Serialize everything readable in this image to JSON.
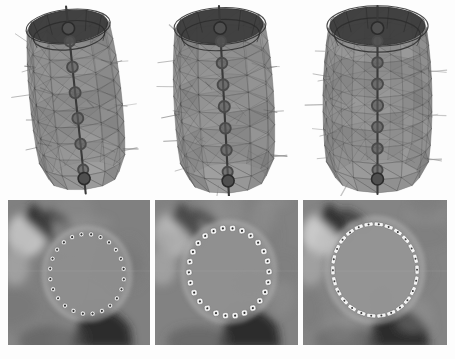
{
  "figure": {
    "layout": "2 rows x 3 columns",
    "background_color": "#fdfdfd",
    "rows": [
      {
        "row_name": "mesh-row",
        "description": "Wireframe triangulated 3D cylindrical mesh models shown from an oblique viewpoint, each with radial normal spikes and a central vertical chain of ring landmarks"
      },
      {
        "row_name": "slice-row",
        "description": "Grayscale cross-sectional image slices with a ring of contour control-point markers outlining a roughly circular structure"
      }
    ]
  },
  "meshes": [
    {
      "panel_name": "mesh-stage-1",
      "stage_label": "1",
      "shape": "narrow rounded cylinder",
      "mesh_color": "#6f6f6f",
      "edge_color": "#2b2b2b",
      "spike_color": "#8c8c8c",
      "ring_marker_color": "#4a4a4a",
      "ring_count": 6,
      "rim_rings": 2,
      "axis_tilt_deg": -6,
      "body_width": 92,
      "body_height": 150,
      "top_spike": true,
      "bottom_spike": true,
      "circumferential_bands": 9,
      "longitudinal_columns": 12,
      "spike_count": 26
    },
    {
      "panel_name": "mesh-stage-2",
      "stage_label": "2",
      "shape": "medium rounded cylinder",
      "mesh_color": "#757575",
      "edge_color": "#2b2b2b",
      "spike_color": "#8f8f8f",
      "ring_marker_color": "#4a4a4a",
      "ring_count": 7,
      "rim_rings": 2,
      "axis_tilt_deg": -3,
      "body_width": 100,
      "body_height": 152,
      "top_spike": true,
      "bottom_spike": true,
      "circumferential_bands": 9,
      "longitudinal_columns": 12,
      "spike_count": 28
    },
    {
      "panel_name": "mesh-stage-3",
      "stage_label": "3",
      "shape": "wide barrel cylinder",
      "mesh_color": "#7a7a7a",
      "edge_color": "#2b2b2b",
      "spike_color": "#949494",
      "ring_marker_color": "#4a4a4a",
      "ring_count": 7,
      "rim_rings": 2,
      "axis_tilt_deg": 0,
      "body_width": 110,
      "body_height": 150,
      "top_spike": true,
      "bottom_spike": true,
      "circumferential_bands": 9,
      "longitudinal_columns": 13,
      "spike_count": 30
    }
  ],
  "slices": [
    {
      "panel_name": "slice-stage-1",
      "stage_label": "1",
      "background_gray": "#808080",
      "interior_gray": "#8e8e8e",
      "bright_blob_gray": "#c8c8c8",
      "dark_band_gray": "#262626",
      "marker_count": 24,
      "marker_shape": "circle",
      "marker_fill": "#f2f2f2",
      "marker_center_dot": "#1e1e1e",
      "marker_size": 5,
      "contour_rx": 37,
      "contour_ry": 40,
      "contour_cx": 79,
      "contour_cy": 74,
      "contour_rotation_deg": -8
    },
    {
      "panel_name": "slice-stage-2",
      "stage_label": "2",
      "background_gray": "#828282",
      "interior_gray": "#909090",
      "bright_blob_gray": "#c8c8c8",
      "dark_band_gray": "#262626",
      "marker_count": 26,
      "marker_shape": "rounded-square",
      "marker_fill": "#f2f2f2",
      "marker_center_dot": "#1e1e1e",
      "marker_size": 6,
      "contour_rx": 40,
      "contour_ry": 44,
      "contour_cx": 74,
      "contour_cy": 72,
      "contour_rotation_deg": -8
    },
    {
      "panel_name": "slice-stage-3",
      "stage_label": "3",
      "background_gray": "#848484",
      "interior_gray": "#949494",
      "bright_blob_gray": "#cccccc",
      "dark_band_gray": "#282828",
      "marker_count": 26,
      "marker_shape": "dash",
      "marker_fill": "#f4f4f4",
      "marker_center_dot": "#1e1e1e",
      "marker_length": 9,
      "marker_thickness": 4,
      "contour_rx": 42,
      "contour_ry": 46,
      "contour_cx": 72,
      "contour_cy": 70,
      "contour_rotation_deg": -8
    }
  ]
}
